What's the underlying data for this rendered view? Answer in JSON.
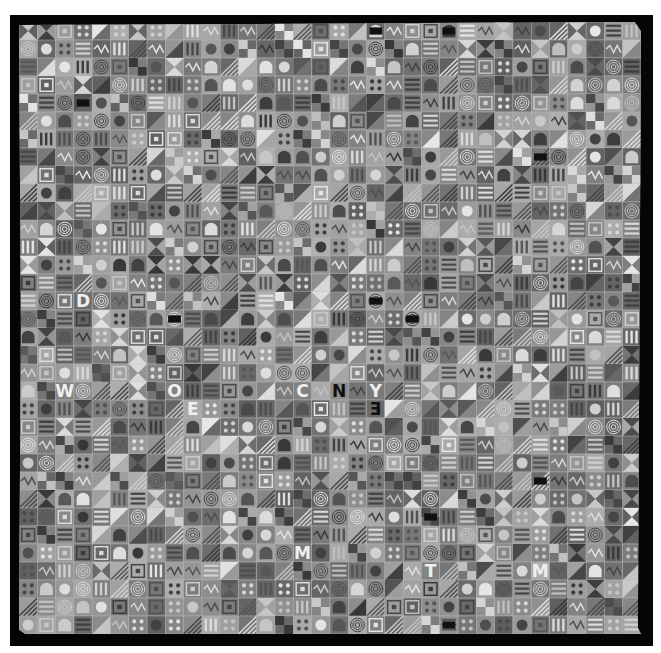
{
  "image": {
    "subject": "grayscale photograph of a patchwork quilt",
    "description": "Dense grid of small square fabric tiles in shades of gray, each bearing a motif such as spirals, stripes, triangles, dots, arches, concentric squares, zigzags and stylized letters, set on a black backing with a white surround.",
    "palette": {
      "background": "#ffffff",
      "border": "#050505",
      "tile_dark": "#3a3a3a",
      "tile_mid": "#8a8a8a",
      "tile_light": "#cfcfcf",
      "highlight": "#eeeeee",
      "black_accent": "#111111"
    },
    "grid": {
      "columns": 34,
      "rows": 34
    },
    "motifs": [
      "spiral",
      "stripes",
      "triangle",
      "dots",
      "arch",
      "concentric-square",
      "zigzag",
      "circle",
      "checker",
      "letter"
    ],
    "visible_letters": [
      "N",
      "Y",
      "E",
      "M",
      "T",
      "O",
      "W",
      "C",
      "D"
    ],
    "featured_letters": [
      {
        "char": "N",
        "col": 17,
        "row": 20,
        "dark": true
      },
      {
        "char": "Y",
        "col": 19,
        "row": 20,
        "dark": false
      },
      {
        "char": "E",
        "col": 19,
        "row": 21,
        "dark": true,
        "mirrored": true
      },
      {
        "char": "E",
        "col": 9,
        "row": 21,
        "dark": false
      },
      {
        "char": "M",
        "col": 15,
        "row": 29,
        "dark": false
      },
      {
        "char": "M",
        "col": 28,
        "row": 30,
        "dark": false
      },
      {
        "char": "T",
        "col": 22,
        "row": 30,
        "dark": false
      },
      {
        "char": "O",
        "col": 8,
        "row": 20,
        "dark": false
      },
      {
        "char": "W",
        "col": 2,
        "row": 20,
        "dark": false
      },
      {
        "char": "C",
        "col": 15,
        "row": 20,
        "dark": false
      },
      {
        "char": "D",
        "col": 3,
        "row": 15,
        "dark": false
      }
    ]
  }
}
